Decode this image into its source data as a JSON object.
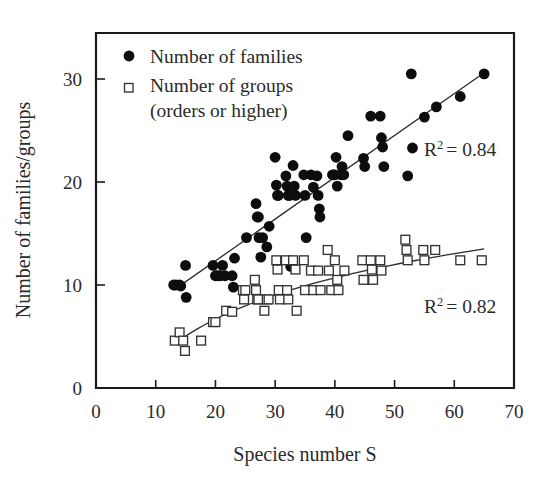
{
  "chart_data": {
    "type": "scatter",
    "title": "",
    "xlabel": "Species number S",
    "ylabel": "Number of families/groups",
    "xlim": [
      0,
      70
    ],
    "ylim": [
      0,
      33
    ],
    "xticks": [
      0,
      10,
      20,
      30,
      40,
      50,
      60,
      70
    ],
    "yticks": [
      0,
      10,
      20,
      30
    ],
    "grid": false,
    "legend_position": "top-left",
    "series": [
      {
        "name": "Number of families",
        "marker": "filled-circle",
        "color": "#0d0d0d",
        "r_squared": 0.84,
        "r2_annotation": "R2 = 0.84",
        "trendline": {
          "type": "linear",
          "x_start": 13.0,
          "y_start": 9.5,
          "x_end": 65.0,
          "y_end": 30.6
        },
        "points": [
          [
            13.0,
            10.0
          ],
          [
            13.4,
            10.0
          ],
          [
            14.0,
            10.0
          ],
          [
            14.2,
            9.9
          ],
          [
            15.0,
            11.9
          ],
          [
            15.1,
            8.8
          ],
          [
            19.6,
            11.9
          ],
          [
            20.0,
            10.9
          ],
          [
            20.4,
            10.9
          ],
          [
            20.8,
            10.9
          ],
          [
            21.2,
            11.9
          ],
          [
            21.6,
            10.9
          ],
          [
            22.8,
            10.9
          ],
          [
            23.0,
            9.8
          ],
          [
            23.2,
            12.6
          ],
          [
            25.2,
            14.6
          ],
          [
            26.8,
            17.9
          ],
          [
            27.0,
            16.6
          ],
          [
            27.2,
            16.6
          ],
          [
            27.3,
            14.6
          ],
          [
            27.6,
            12.7
          ],
          [
            27.9,
            14.6
          ],
          [
            28.6,
            13.7
          ],
          [
            29.0,
            15.7
          ],
          [
            30.0,
            22.4
          ],
          [
            30.2,
            19.7
          ],
          [
            30.4,
            18.7
          ],
          [
            30.5,
            18.7
          ],
          [
            31.8,
            20.6
          ],
          [
            32.0,
            19.6
          ],
          [
            32.2,
            18.7
          ],
          [
            32.4,
            18.7
          ],
          [
            32.6,
            11.8
          ],
          [
            33.0,
            21.6
          ],
          [
            33.2,
            19.6
          ],
          [
            33.4,
            18.7
          ],
          [
            34.8,
            20.7
          ],
          [
            35.0,
            18.7
          ],
          [
            35.2,
            14.6
          ],
          [
            36.0,
            20.7
          ],
          [
            36.4,
            19.5
          ],
          [
            37.0,
            20.6
          ],
          [
            37.2,
            18.7
          ],
          [
            37.4,
            17.4
          ],
          [
            37.5,
            16.6
          ],
          [
            39.6,
            20.7
          ],
          [
            39.8,
            20.7
          ],
          [
            40.0,
            20.7
          ],
          [
            40.2,
            22.4
          ],
          [
            40.4,
            19.6
          ],
          [
            41.0,
            20.7
          ],
          [
            41.2,
            21.5
          ],
          [
            41.5,
            20.7
          ],
          [
            42.2,
            24.5
          ],
          [
            44.8,
            22.3
          ],
          [
            45.0,
            21.5
          ],
          [
            46.0,
            26.4
          ],
          [
            47.6,
            26.4
          ],
          [
            47.8,
            24.3
          ],
          [
            48.0,
            23.4
          ],
          [
            48.2,
            21.5
          ],
          [
            52.2,
            20.6
          ],
          [
            52.8,
            30.5
          ],
          [
            53.0,
            23.3
          ],
          [
            55.0,
            26.3
          ],
          [
            57.0,
            27.3
          ],
          [
            61.0,
            28.3
          ],
          [
            65.0,
            30.5
          ]
        ]
      },
      {
        "name": "Number of groups (orders or higher)",
        "marker": "open-square",
        "color": "#333333",
        "r_squared": 0.82,
        "r2_annotation": "R2 = 0.82",
        "trendline": {
          "type": "logarithmic",
          "x_start": 13.0,
          "y_start": 4.2,
          "x_end": 65.0,
          "y_end": 13.5
        },
        "points": [
          [
            13.2,
            4.6
          ],
          [
            14.0,
            5.4
          ],
          [
            14.6,
            4.6
          ],
          [
            14.9,
            3.6
          ],
          [
            17.6,
            4.6
          ],
          [
            19.6,
            6.4
          ],
          [
            20.0,
            6.4
          ],
          [
            21.8,
            7.5
          ],
          [
            22.8,
            7.4
          ],
          [
            24.6,
            9.5
          ],
          [
            24.8,
            8.6
          ],
          [
            25.0,
            9.5
          ],
          [
            26.6,
            10.5
          ],
          [
            26.8,
            9.5
          ],
          [
            27.0,
            8.6
          ],
          [
            27.2,
            8.6
          ],
          [
            28.2,
            7.5
          ],
          [
            28.6,
            8.6
          ],
          [
            28.9,
            8.6
          ],
          [
            30.2,
            12.4
          ],
          [
            30.4,
            11.5
          ],
          [
            30.6,
            9.5
          ],
          [
            30.8,
            8.6
          ],
          [
            31.8,
            12.4
          ],
          [
            32.0,
            9.5
          ],
          [
            32.2,
            8.6
          ],
          [
            33.0,
            12.4
          ],
          [
            33.4,
            11.5
          ],
          [
            33.6,
            7.5
          ],
          [
            34.8,
            12.4
          ],
          [
            35.0,
            9.5
          ],
          [
            36.0,
            11.4
          ],
          [
            36.4,
            9.5
          ],
          [
            37.2,
            11.4
          ],
          [
            37.6,
            9.5
          ],
          [
            38.8,
            13.4
          ],
          [
            39.0,
            11.4
          ],
          [
            39.4,
            9.5
          ],
          [
            40.0,
            12.4
          ],
          [
            40.4,
            10.5
          ],
          [
            40.6,
            9.5
          ],
          [
            41.6,
            11.4
          ],
          [
            44.6,
            12.4
          ],
          [
            44.8,
            10.5
          ],
          [
            46.0,
            12.4
          ],
          [
            46.2,
            11.5
          ],
          [
            46.4,
            10.5
          ],
          [
            47.6,
            12.4
          ],
          [
            47.8,
            11.4
          ],
          [
            51.8,
            14.4
          ],
          [
            52.0,
            13.4
          ],
          [
            52.2,
            12.4
          ],
          [
            54.8,
            13.4
          ],
          [
            55.0,
            12.4
          ],
          [
            56.8,
            13.4
          ],
          [
            61.0,
            12.4
          ],
          [
            64.6,
            12.4
          ]
        ]
      }
    ]
  },
  "legend": {
    "entries": [
      {
        "label": "Number of families",
        "marker": "filled-circle"
      },
      {
        "label": "Number of groups",
        "marker": "open-square"
      },
      {
        "label": "(orders or higher)",
        "marker": "none"
      }
    ]
  },
  "annotations": {
    "r2_families_prefix": "R",
    "r2_families_sup": "2",
    "r2_families_value": "= 0.84",
    "r2_groups_prefix": "R",
    "r2_groups_sup": "2",
    "r2_groups_value": "= 0.82"
  },
  "axes": {
    "x_title": "Species number S",
    "y_title": "Number of families/groups",
    "x_tick_labels": [
      "0",
      "10",
      "20",
      "30",
      "40",
      "50",
      "60",
      "70"
    ],
    "y_tick_labels": [
      "0",
      "10",
      "20",
      "30"
    ]
  },
  "colors": {
    "ink": "#1a1a1a",
    "marker_fill": "#0d0d0d",
    "marker_stroke": "#333333",
    "background": "#ffffff"
  }
}
